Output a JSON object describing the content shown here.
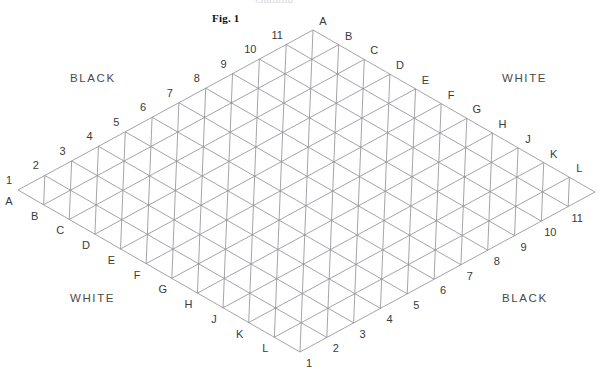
{
  "figure": {
    "caption": "Fig. 1",
    "caption_x": 212,
    "caption_y": 12
  },
  "board": {
    "shape": "rhombus-triangular-grid",
    "cells_per_side": 11,
    "vertices": {
      "left": {
        "x": 18,
        "y": 190
      },
      "top": {
        "x": 313,
        "y": 30
      },
      "right": {
        "x": 594,
        "y": 190
      },
      "bottom": {
        "x": 300,
        "y": 352
      }
    },
    "line_color": "#8d8d93",
    "line_width": 0.8
  },
  "region_labels": [
    {
      "text": "BLACK",
      "x": 70,
      "y": 72
    },
    {
      "text": "WHITE",
      "x": 502,
      "y": 72
    },
    {
      "text": "WHITE",
      "x": 70,
      "y": 292
    },
    {
      "text": "BLACK",
      "x": 502,
      "y": 292
    }
  ],
  "edges": {
    "upper_left_numbers": [
      "1",
      "2",
      "3",
      "4",
      "5",
      "6",
      "7",
      "8",
      "9",
      "10",
      "11"
    ],
    "upper_right_letters": [
      "A",
      "B",
      "C",
      "D",
      "E",
      "F",
      "G",
      "H",
      "J",
      "K",
      "L"
    ],
    "lower_left_letters": [
      "A",
      "B",
      "C",
      "D",
      "E",
      "F",
      "G",
      "H",
      "J",
      "K",
      "L"
    ],
    "lower_right_numbers": [
      "1",
      "2",
      "3",
      "4",
      "5",
      "6",
      "7",
      "8",
      "9",
      "10",
      "11"
    ]
  },
  "corner_pairs": {
    "left": {
      "number": "1",
      "letter": "A"
    },
    "top": {
      "number": "11",
      "letter": "A"
    },
    "right": {
      "letter": "L",
      "number": "11"
    },
    "bottom": {
      "letter": "L",
      "number": "1"
    }
  },
  "top_cropped_text": "Gamma"
}
